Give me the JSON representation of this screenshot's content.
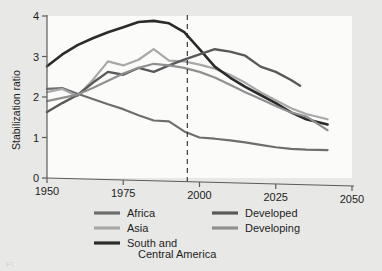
{
  "chart_data": {
    "type": "line",
    "title": "",
    "xlabel": "",
    "ylabel": "Stabilization ratio",
    "xlim": [
      1950,
      2050
    ],
    "ylim": [
      0,
      4
    ],
    "xticks": [
      1950,
      1975,
      2000,
      2025,
      2050
    ],
    "yticks": [
      0,
      1,
      2,
      3,
      4
    ],
    "grid": false,
    "legend_position": "below-plot-two-columns",
    "annotations": [
      {
        "type": "vertical-dashed-line",
        "x": 1996,
        "label": ""
      }
    ],
    "series": [
      {
        "name": "Africa",
        "color": "#6e6e6e",
        "x": [
          1950,
          1955,
          1960,
          1965,
          1970,
          1975,
          1980,
          1985,
          1990,
          1995,
          2000,
          2005,
          2010,
          2015,
          2020,
          2025,
          2030,
          2035,
          2042
        ],
        "values": [
          2.2,
          2.22,
          2.08,
          1.95,
          1.82,
          1.7,
          1.55,
          1.42,
          1.4,
          1.15,
          1.0,
          0.97,
          0.93,
          0.88,
          0.82,
          0.76,
          0.72,
          0.7,
          0.69
        ]
      },
      {
        "name": "Asia",
        "color": "#a8a8a8",
        "x": [
          1950,
          1955,
          1960,
          1965,
          1970,
          1975,
          1980,
          1985,
          1990,
          1995,
          2000,
          2005,
          2010,
          2015,
          2020,
          2025,
          2030,
          2035,
          2042
        ],
        "values": [
          2.12,
          2.2,
          2.02,
          2.42,
          2.88,
          2.78,
          2.92,
          3.18,
          2.9,
          2.88,
          2.8,
          2.7,
          2.55,
          2.35,
          2.12,
          1.92,
          1.72,
          1.58,
          1.45
        ]
      },
      {
        "name": "South and Central America",
        "color": "#2b2b2b",
        "x": [
          1950,
          1955,
          1960,
          1965,
          1970,
          1975,
          1980,
          1985,
          1990,
          1995,
          2000,
          2005,
          2010,
          2015,
          2020,
          2025,
          2030,
          2035,
          2042
        ],
        "values": [
          2.76,
          3.05,
          3.28,
          3.45,
          3.6,
          3.72,
          3.85,
          3.88,
          3.82,
          3.6,
          3.18,
          2.75,
          2.48,
          2.25,
          2.05,
          1.85,
          1.62,
          1.45,
          1.32
        ]
      },
      {
        "name": "Developed",
        "color": "#595959",
        "x": [
          1950,
          1955,
          1960,
          1965,
          1970,
          1975,
          1980,
          1985,
          1990,
          1995,
          2000,
          2005,
          2010,
          2015,
          2020,
          2025,
          2030,
          2033
        ],
        "values": [
          1.63,
          1.85,
          2.05,
          2.35,
          2.62,
          2.55,
          2.72,
          2.62,
          2.78,
          2.92,
          3.05,
          3.18,
          3.12,
          3.02,
          2.75,
          2.62,
          2.42,
          2.28
        ]
      },
      {
        "name": "Developing",
        "color": "#909090",
        "x": [
          1950,
          1955,
          1960,
          1965,
          1970,
          1975,
          1980,
          1985,
          1990,
          1995,
          2000,
          2005,
          2010,
          2015,
          2020,
          2025,
          2030,
          2035,
          2042
        ],
        "values": [
          1.9,
          1.98,
          2.06,
          2.22,
          2.4,
          2.58,
          2.72,
          2.82,
          2.78,
          2.72,
          2.62,
          2.48,
          2.3,
          2.12,
          1.95,
          1.78,
          1.62,
          1.52,
          1.18
        ]
      }
    ]
  },
  "legend": {
    "column_left": [
      {
        "label": "Africa",
        "color": "#6e6e6e"
      },
      {
        "label": "Asia",
        "color": "#a8a8a8"
      },
      {
        "label": "South and",
        "label2": "Central America",
        "color": "#2b2b2b"
      }
    ],
    "column_right": [
      {
        "label": "Developed",
        "color": "#595959"
      },
      {
        "label": "Developing",
        "color": "#909090"
      }
    ]
  },
  "axis": {
    "ylabel": "Stabilization ratio",
    "ytick_0": "0",
    "ytick_1": "1",
    "ytick_2": "2",
    "ytick_3": "3",
    "ytick_4": "4",
    "xtick_1950": "1950",
    "xtick_1975": "1975",
    "xtick_2000": "2000",
    "xtick_2025": "2025",
    "xtick_2050": "2050"
  },
  "caption": {
    "ghost_text": "Fi"
  }
}
